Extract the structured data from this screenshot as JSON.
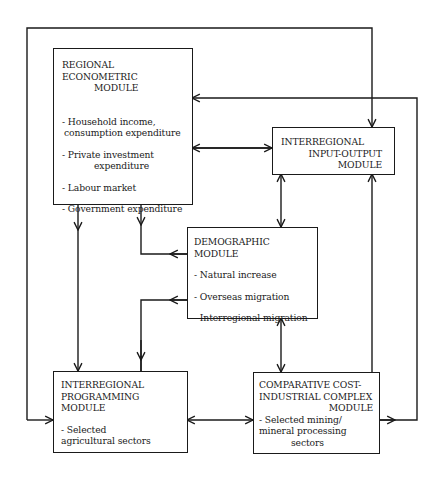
{
  "diagram": {
    "regional": {
      "title_line1": "REGIONAL ECONOMETRIC",
      "title_line2": "MODULE",
      "items": [
        {
          "line1": "- Household income,",
          "line2": "consumption expenditure"
        },
        {
          "line1": "- Private investment",
          "line2": "expenditure"
        },
        {
          "line1": "- Labour market"
        },
        {
          "line1": "- Government expenditure"
        }
      ]
    },
    "input_output": {
      "title_line1": "INTERREGIONAL",
      "title_line2": "INPUT-OUTPUT",
      "title_line3": "MODULE"
    },
    "demographic": {
      "title": "DEMOGRAPHIC MODULE",
      "items": [
        "- Natural increase",
        "- Overseas migration",
        "- Interregional migration"
      ]
    },
    "programming": {
      "title_line1": "INTERREGIONAL",
      "title_line2": "PROGRAMMING MODULE",
      "item_line1": "- Selected",
      "item_line2": "agricultural sectors"
    },
    "comparative_cost": {
      "title_line1": "COMPARATIVE COST-",
      "title_line2": "INDUSTRIAL COMPLEX",
      "title_line3": "MODULE",
      "item_line1": "- Selected mining/",
      "item_line2": "mineral processing",
      "item_line3": "sectors"
    },
    "line_color": "#1a1a1a"
  }
}
